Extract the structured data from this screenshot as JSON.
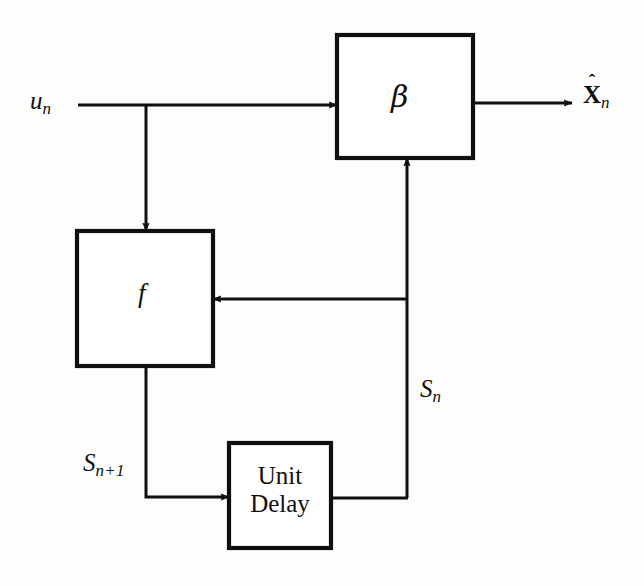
{
  "figure": {
    "type": "block-diagram",
    "background_color": "#fdfdfc",
    "line_color": "#100f0d"
  },
  "labels": {
    "input": "u",
    "input_sub": "n",
    "beta_block": "β",
    "output_base": "X",
    "output_accent": "ˆ",
    "output_sub": "n",
    "f_block": "f",
    "state_current": "S",
    "state_current_sub": "n",
    "state_next": "S",
    "state_next_sub": "n+1",
    "unit_delay": "Unit Delay"
  },
  "blocks": [
    {
      "name": "beta-block",
      "label": "β",
      "x": 337,
      "y": 35,
      "width": 136,
      "height": 123
    },
    {
      "name": "f-block",
      "label": "f",
      "x": 77,
      "y": 231,
      "width": 136,
      "height": 135
    },
    {
      "name": "unit-delay-block",
      "label": "Unit Delay",
      "x": 229,
      "y": 443,
      "width": 102,
      "height": 105
    }
  ],
  "connections": [
    {
      "name": "input-to-beta",
      "label": "u_n",
      "from": "input",
      "to": "beta-block"
    },
    {
      "name": "input-branch-to-f",
      "label": "u_n",
      "from": "input",
      "to": "f-block"
    },
    {
      "name": "beta-to-output",
      "label": "X_n",
      "from": "beta-block",
      "to": "output"
    },
    {
      "name": "state-to-beta",
      "label": "S_n",
      "from": "unit-delay-block",
      "to": "beta-block"
    },
    {
      "name": "state-to-f",
      "label": "S_n",
      "from": "unit-delay-block",
      "to": "f-block"
    },
    {
      "name": "f-to-unit-delay",
      "label": "S_n+1",
      "from": "f-block",
      "to": "unit-delay-block"
    }
  ]
}
